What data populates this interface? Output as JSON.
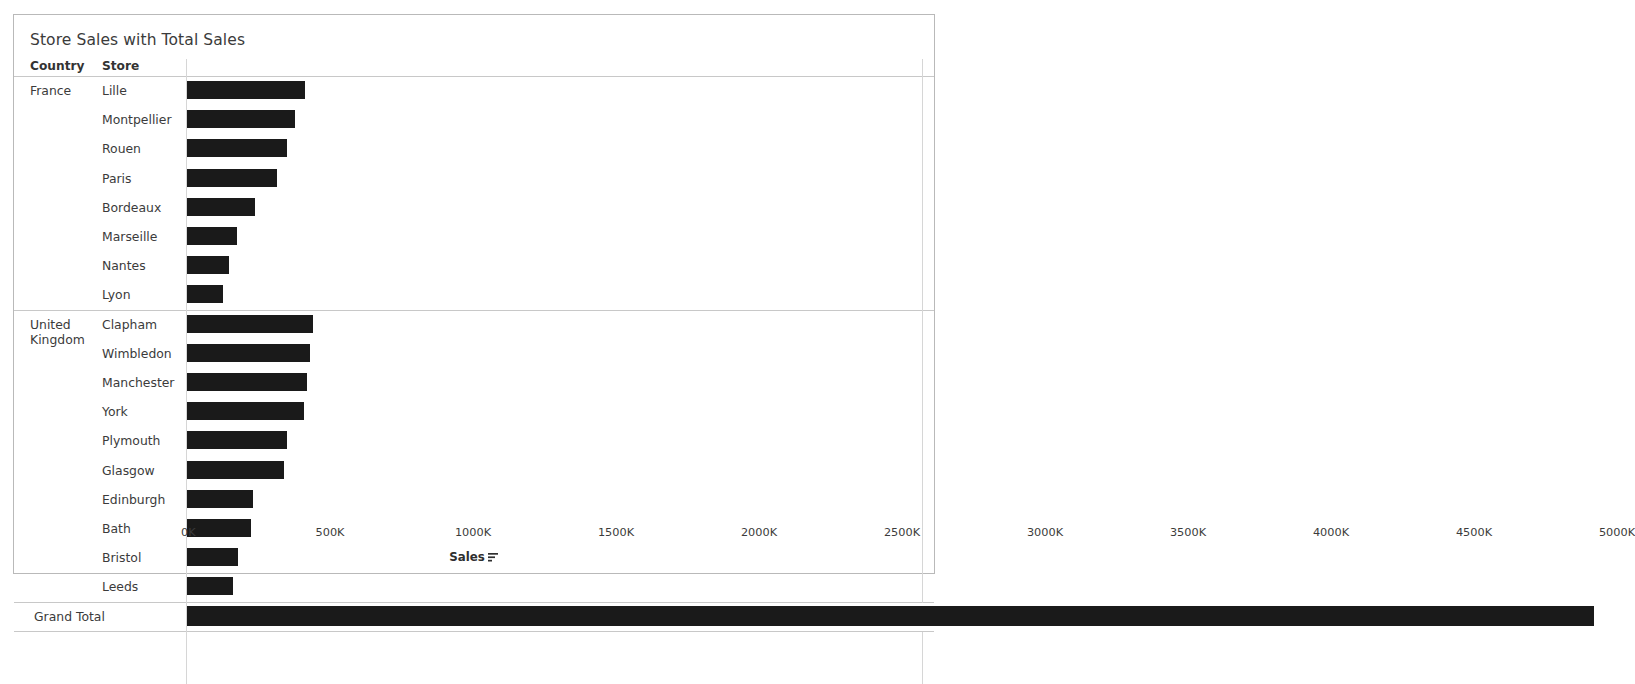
{
  "title": "Store Sales with Total Sales",
  "table_header": {
    "country": "Country",
    "store": "Store"
  },
  "grand_total_label": "Grand Total",
  "axis": {
    "title": "Sales",
    "sort_icon": "sort-descending-icon",
    "tick_labels": [
      "0K",
      "500K",
      "1000K",
      "1500K",
      "2000K",
      "2500K",
      "3000K",
      "3500K",
      "4000K",
      "4500K",
      "5000K"
    ],
    "tick_values": [
      0,
      500000,
      1000000,
      1500000,
      2000000,
      2500000,
      3000000,
      3500000,
      4000000,
      4500000,
      5000000
    ],
    "min": 0,
    "max": 5000000
  },
  "colors": {
    "bar": "#1a1a1a",
    "frame": "#b9b9b9",
    "rule": "#c8c8c8",
    "text": "#3b3b3b",
    "background": "#ffffff"
  },
  "chart_data": {
    "type": "bar",
    "orientation": "horizontal",
    "title": "Store Sales with Total Sales",
    "xlabel": "Sales",
    "ylabel": "",
    "xlim": [
      0,
      5000000
    ],
    "grid": false,
    "legend": null,
    "sorted": "descending within group",
    "groups": [
      {
        "country": "France",
        "rows": [
          {
            "store": "Lille",
            "value": 412000
          },
          {
            "store": "Montpellier",
            "value": 378000
          },
          {
            "store": "Rouen",
            "value": 350000
          },
          {
            "store": "Paris",
            "value": 316000
          },
          {
            "store": "Bordeaux",
            "value": 238000
          },
          {
            "store": "Marseille",
            "value": 175000
          },
          {
            "store": "Nantes",
            "value": 148000
          },
          {
            "store": "Lyon",
            "value": 126000
          }
        ]
      },
      {
        "country": "United Kingdom",
        "rows": [
          {
            "store": "Clapham",
            "value": 440000
          },
          {
            "store": "Wimbledon",
            "value": 430000
          },
          {
            "store": "Manchester",
            "value": 420000
          },
          {
            "store": "York",
            "value": 410000
          },
          {
            "store": "Plymouth",
            "value": 350000
          },
          {
            "store": "Glasgow",
            "value": 340000
          },
          {
            "store": "Edinburgh",
            "value": 230000
          },
          {
            "store": "Bath",
            "value": 225000
          },
          {
            "store": "Bristol",
            "value": 180000
          },
          {
            "store": "Leeds",
            "value": 160000
          }
        ]
      }
    ],
    "grand_total": {
      "label": "Grand Total",
      "value": 4920000
    }
  }
}
